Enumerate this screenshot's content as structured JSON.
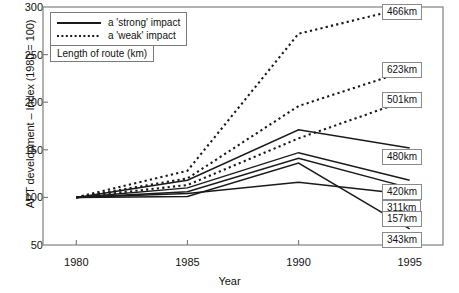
{
  "chart_data": {
    "type": "line",
    "title": "",
    "xlabel": "Year",
    "ylabel": "APT development – Index (1980 = 100)",
    "x": [
      1980,
      1985,
      1990,
      1995
    ],
    "xlim": [
      1978.5,
      1996.5
    ],
    "ylim": [
      50,
      300
    ],
    "xticks": [
      "1980",
      "1985",
      "1990",
      "1995"
    ],
    "yticks": [
      "50",
      "100",
      "150",
      "200",
      "250",
      "300"
    ],
    "grid": false,
    "legend_position": "top-left",
    "legend": [
      {
        "label": "a 'strong' impact",
        "style": "solid"
      },
      {
        "label": "a 'weak' impact",
        "style": "dotted"
      }
    ],
    "annotation_box": "Length of route (km)",
    "series": [
      {
        "name": "466km",
        "style": "dotted",
        "label": "466km",
        "values": [
          100,
          128,
          272,
          300
        ]
      },
      {
        "name": "623km",
        "style": "dotted",
        "label": "623km",
        "values": [
          100,
          120,
          196,
          234
        ]
      },
      {
        "name": "501km",
        "style": "dotted",
        "label": "501km",
        "values": [
          100,
          113,
          162,
          203
        ]
      },
      {
        "name": "480km",
        "style": "solid",
        "label": "480km",
        "values": [
          100,
          118,
          171,
          152
        ]
      },
      {
        "name": "420km",
        "style": "solid",
        "label": "420km",
        "values": [
          100,
          110,
          147,
          118
        ]
      },
      {
        "name": "311km",
        "style": "solid",
        "label": "311km",
        "values": [
          100,
          106,
          141,
          110
        ]
      },
      {
        "name": "157km",
        "style": "solid",
        "label": "157km",
        "values": [
          100,
          104,
          116,
          103
        ]
      },
      {
        "name": "343km",
        "style": "solid",
        "label": "343km",
        "values": [
          100,
          101,
          136,
          67
        ]
      }
    ],
    "colors": {
      "line": "#1a1a1a",
      "axis": "#808080",
      "label_border": "#8a8a8a"
    }
  }
}
